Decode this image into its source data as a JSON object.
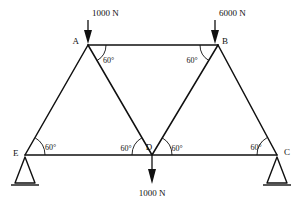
{
  "figure": {
    "type": "truss-free-body-diagram",
    "background_color": "#ffffff",
    "line_color": "#101010"
  },
  "nodes": [
    {
      "id": "A",
      "label": "A",
      "x": 88,
      "y": 45,
      "label_x": 79,
      "label_y": 44
    },
    {
      "id": "B",
      "label": "B",
      "x": 218,
      "y": 45,
      "label_x": 222,
      "label_y": 44
    },
    {
      "id": "C",
      "label": "C",
      "x": 277,
      "y": 155,
      "label_x": 284,
      "label_y": 155
    },
    {
      "id": "D",
      "label": "D",
      "x": 152,
      "y": 155,
      "label_x": 149,
      "label_y": 150
    },
    {
      "id": "E",
      "label": "E",
      "x": 25,
      "y": 155,
      "label_x": 13,
      "label_y": 156
    }
  ],
  "members": [
    {
      "name": "member-A-B",
      "from": "A",
      "to": "B"
    },
    {
      "name": "member-E-C",
      "from": "E",
      "to": "C"
    },
    {
      "name": "member-E-A",
      "from": "E",
      "to": "A"
    },
    {
      "name": "member-A-D",
      "from": "A",
      "to": "D"
    },
    {
      "name": "member-D-B",
      "from": "D",
      "to": "B"
    },
    {
      "name": "member-B-C",
      "from": "B",
      "to": "C"
    }
  ],
  "loads": [
    {
      "name": "load-at-A",
      "label": "1000 N",
      "magnitude": 1000,
      "unit": "N",
      "direction": "down",
      "at_node": "A",
      "shaft_x": 88,
      "shaft_y_top": 20,
      "shaft_y_bottom": 43,
      "label_x": 92,
      "label_y": 16
    },
    {
      "name": "load-at-B",
      "label": "6000 N",
      "magnitude": 6000,
      "unit": "N",
      "direction": "down",
      "at_node": "B",
      "shaft_x": 215,
      "shaft_y_top": 20,
      "shaft_y_bottom": 43,
      "label_x": 219,
      "label_y": 16
    },
    {
      "name": "load-at-D",
      "label": "1000 N",
      "magnitude": 1000,
      "unit": "N",
      "direction": "down",
      "at_node": "D",
      "shaft_x": 152,
      "shaft_y_top": 157,
      "shaft_y_bottom": 182,
      "label_x": 152,
      "label_y": 196
    }
  ],
  "angles": [
    {
      "name": "angle-at-A",
      "label": "60°",
      "value": 60,
      "unit": "degrees",
      "label_x": 103,
      "label_y": 63
    },
    {
      "name": "angle-at-B",
      "label": "60°",
      "value": 60,
      "unit": "degrees",
      "label_x": 192,
      "label_y": 63
    },
    {
      "name": "angle-at-E",
      "label": "60°",
      "value": 60,
      "unit": "degrees",
      "label_x": 45,
      "label_y": 150
    },
    {
      "name": "angle-at-D-left",
      "label": "60°",
      "value": 60,
      "unit": "degrees",
      "label_x": 126,
      "label_y": 151
    },
    {
      "name": "angle-at-D-right",
      "label": "60°",
      "value": 60,
      "unit": "degrees",
      "label_x": 177,
      "label_y": 151
    },
    {
      "name": "angle-at-C",
      "label": "60°",
      "value": 60,
      "unit": "degrees",
      "label_x": 256,
      "label_y": 150
    }
  ],
  "supports": [
    {
      "name": "support-at-E",
      "at_node": "E",
      "type": "triangle",
      "apex_x": 25,
      "apex_y": 157,
      "base_left_x": 15,
      "base_right_x": 35,
      "base_y": 183,
      "ground_left_x": 11,
      "ground_right_x": 39,
      "ground_y": 185
    },
    {
      "name": "support-at-C",
      "at_node": "C",
      "type": "triangle",
      "apex_x": 277,
      "apex_y": 157,
      "base_left_x": 267,
      "base_right_x": 287,
      "base_y": 183,
      "ground_left_x": 263,
      "ground_right_x": 291,
      "ground_y": 185
    }
  ]
}
